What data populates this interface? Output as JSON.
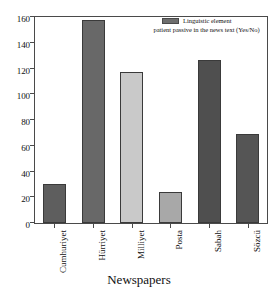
{
  "chart_data": {
    "type": "bar",
    "title": "",
    "xlabel": "Newspapers",
    "ylabel": "",
    "categories": [
      "Cumhuriyet",
      "Hürriyet",
      "Milliyet",
      "Posta",
      "Sabah",
      "Sözcü"
    ],
    "values": [
      30,
      158,
      117,
      24,
      127,
      69
    ],
    "bar_colors": [
      "#5e5e5e",
      "#686868",
      "#c9c9c9",
      "#a8a8a8",
      "#4f4f4f",
      "#555555"
    ],
    "ylim": [
      0,
      160
    ],
    "yticks": [
      0,
      20,
      40,
      60,
      80,
      100,
      120,
      140,
      160
    ],
    "ytick_labels": [
      "0",
      "20",
      "40",
      "60",
      "80",
      "100",
      "120",
      "140",
      "160"
    ],
    "grid": false,
    "legend_position": "top-right",
    "series": [
      {
        "name": "Linguistic element patient passive in the news text (Yes/No)",
        "values": [
          30,
          158,
          117,
          24,
          127,
          69
        ]
      }
    ]
  },
  "legend": {
    "line1": "Linguistic element",
    "line2": "patient passive in the news text (Yes/No)",
    "swatch_color": "#6e6e6e"
  },
  "axes": {
    "x_title": "Newspapers"
  }
}
